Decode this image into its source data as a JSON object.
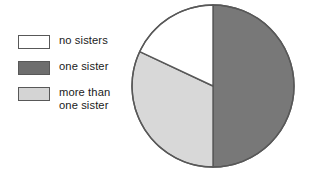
{
  "figure": {
    "background_color": "#ffffff",
    "outline_color": "#585858"
  },
  "legend": {
    "position": "left",
    "items": [
      {
        "label": "no sisters",
        "color": "#ffffff",
        "swatch_icon": "white-square-swatch"
      },
      {
        "label": "one sister",
        "color": "#6e6e6e",
        "swatch_icon": "dark-gray-square-swatch"
      },
      {
        "label": "more than\none sister",
        "color": "#d4d4d4",
        "swatch_icon": "light-gray-square-swatch"
      }
    ]
  },
  "chart_data": {
    "type": "pie",
    "title": "",
    "xlabel": "",
    "ylabel": "",
    "grid": false,
    "legend_position": "left",
    "categories": [
      "no sisters",
      "one sister",
      "more than one sister"
    ],
    "values": [
      18,
      50,
      32
    ],
    "value_unit": "percent",
    "colors": [
      "#ffffff",
      "#787878",
      "#d8d8d8"
    ],
    "slice_angles_deg": [
      66,
      180,
      114
    ],
    "start_angle_deg": 0,
    "direction": "clockwise",
    "center": {
      "cx": 82,
      "cy": 82
    },
    "radius": 81,
    "stroke_color": "#585858",
    "stroke_width": 1.4,
    "geometry": {
      "one_sister": {
        "start_deg": 0,
        "end_deg": 180
      },
      "more_than_one_sister": {
        "start_deg": 180,
        "end_deg": 294
      },
      "no_sisters": {
        "start_deg": 294,
        "end_deg": 360
      }
    }
  }
}
